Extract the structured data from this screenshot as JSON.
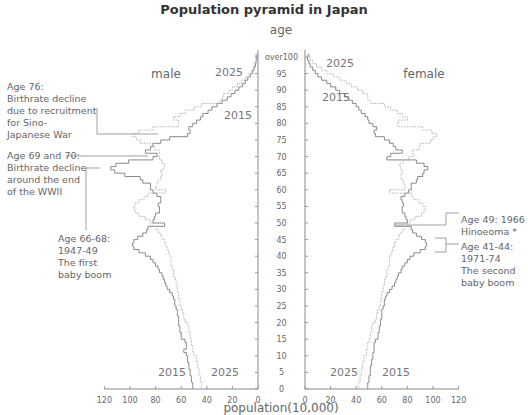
{
  "chart_data": {
    "type": "bar",
    "subtype": "population-pyramid",
    "title": "Population pyramid in Japan",
    "ylabel": "age",
    "xlabel": "population(10,000)",
    "xlim": [
      0,
      120
    ],
    "ylim": [
      0,
      100
    ],
    "x_ticks": [
      0,
      20,
      40,
      60,
      80,
      100,
      120
    ],
    "y_ticks": [
      "0",
      "5",
      "10",
      "15",
      "20",
      "25",
      "30",
      "35",
      "40",
      "45",
      "50",
      "55",
      "60",
      "65",
      "70",
      "75",
      "80",
      "85",
      "90",
      "95",
      "over100"
    ],
    "side_labels": {
      "left": "male",
      "right": "female"
    },
    "grid": false,
    "series_styles": {
      "2015": "solid",
      "2025": "dotted"
    },
    "ages": [
      0,
      1,
      2,
      3,
      4,
      5,
      6,
      7,
      8,
      9,
      10,
      11,
      12,
      13,
      14,
      15,
      16,
      17,
      18,
      19,
      20,
      21,
      22,
      23,
      24,
      25,
      26,
      27,
      28,
      29,
      30,
      31,
      32,
      33,
      34,
      35,
      36,
      37,
      38,
      39,
      40,
      41,
      42,
      43,
      44,
      45,
      46,
      47,
      48,
      49,
      50,
      51,
      52,
      53,
      54,
      55,
      56,
      57,
      58,
      59,
      60,
      61,
      62,
      63,
      64,
      65,
      66,
      67,
      68,
      69,
      70,
      71,
      72,
      73,
      74,
      75,
      76,
      77,
      78,
      79,
      80,
      81,
      82,
      83,
      84,
      85,
      86,
      87,
      88,
      89,
      90,
      91,
      92,
      93,
      94,
      95,
      96,
      97,
      98,
      99,
      100
    ],
    "series": [
      {
        "name": "male 2015",
        "side": "male",
        "year": "2015",
        "values": [
          51,
          51,
          52,
          52,
          53,
          53,
          54,
          54,
          55,
          55,
          56,
          58,
          56,
          56,
          57,
          60,
          60,
          61,
          61,
          62,
          62,
          62,
          63,
          63,
          64,
          65,
          65,
          66,
          67,
          69,
          71,
          72,
          73,
          74,
          75,
          77,
          78,
          80,
          82,
          84,
          88,
          93,
          97,
          98,
          97,
          94,
          90,
          87,
          86,
          73,
          82,
          81,
          80,
          77,
          77,
          78,
          76,
          76,
          79,
          82,
          84,
          84,
          90,
          92,
          104,
          112,
          115,
          111,
          101,
          82,
          79,
          88,
          84,
          82,
          76,
          69,
          55,
          53,
          54,
          51,
          48,
          45,
          43,
          39,
          36,
          32,
          28,
          24,
          21,
          18,
          15,
          12,
          10,
          8,
          6,
          4,
          3,
          2,
          1.5,
          1,
          0.8
        ]
      },
      {
        "name": "male 2025",
        "side": "male",
        "year": "2025",
        "values": [
          44,
          44,
          45,
          45,
          46,
          46,
          47,
          47,
          48,
          48,
          50,
          51,
          51,
          52,
          52,
          53,
          53,
          54,
          54,
          55,
          57,
          58,
          58,
          59,
          60,
          61,
          61,
          62,
          62,
          63,
          63,
          64,
          64,
          65,
          66,
          66,
          67,
          68,
          68,
          68,
          69,
          70,
          71,
          72,
          73,
          75,
          76,
          78,
          80,
          82,
          84,
          88,
          93,
          96,
          97,
          96,
          93,
          89,
          86,
          72,
          80,
          79,
          78,
          76,
          75,
          76,
          74,
          73,
          75,
          77,
          79,
          77,
          81,
          82,
          92,
          95,
          98,
          93,
          82,
          62,
          62,
          66,
          61,
          57,
          50,
          44,
          30,
          28,
          27,
          23,
          20,
          16,
          13,
          10,
          7,
          5,
          4,
          3,
          2,
          1.5,
          1.8
        ]
      },
      {
        "name": "female 2015",
        "side": "female",
        "year": "2015",
        "values": [
          49,
          49,
          50,
          50,
          51,
          51,
          51,
          52,
          52,
          53,
          53,
          54,
          54,
          54,
          55,
          57,
          57,
          58,
          58,
          59,
          59,
          60,
          60,
          60,
          61,
          62,
          62,
          63,
          64,
          66,
          68,
          70,
          71,
          72,
          73,
          75,
          76,
          78,
          80,
          82,
          85,
          90,
          94,
          95,
          94,
          91,
          87,
          84,
          83,
          70,
          80,
          79,
          78,
          76,
          76,
          77,
          76,
          75,
          78,
          81,
          83,
          83,
          87,
          88,
          92,
          93,
          96,
          93,
          87,
          64,
          67,
          76,
          71,
          69,
          66,
          62,
          55,
          54,
          56,
          53,
          50,
          49,
          47,
          44,
          42,
          40,
          37,
          34,
          31,
          27,
          24,
          20,
          17,
          13,
          10,
          8,
          6,
          4,
          3,
          2,
          2.5
        ]
      },
      {
        "name": "female 2025",
        "side": "female",
        "year": "2025",
        "values": [
          42,
          42,
          43,
          43,
          44,
          44,
          45,
          45,
          46,
          46,
          48,
          48,
          49,
          49,
          50,
          51,
          51,
          52,
          52,
          53,
          55,
          56,
          56,
          57,
          58,
          59,
          59,
          60,
          60,
          61,
          61,
          62,
          62,
          63,
          64,
          64,
          65,
          66,
          66,
          66,
          67,
          68,
          69,
          70,
          71,
          73,
          74,
          76,
          78,
          80,
          82,
          86,
          91,
          93,
          94,
          92,
          89,
          85,
          83,
          66,
          78,
          78,
          77,
          75,
          75,
          76,
          75,
          74,
          77,
          81,
          85,
          84,
          89,
          90,
          98,
          100,
          103,
          99,
          92,
          72,
          73,
          80,
          76,
          72,
          67,
          62,
          51,
          49,
          49,
          45,
          41,
          36,
          32,
          27,
          22,
          17,
          13,
          9,
          6,
          4,
          3.5
        ]
      }
    ],
    "year_labels": [
      {
        "text": "2025",
        "side": "male",
        "position": "top"
      },
      {
        "text": "2015",
        "side": "male",
        "position": "top"
      },
      {
        "text": "2015",
        "side": "male",
        "position": "bottom"
      },
      {
        "text": "2025",
        "side": "male",
        "position": "bottom"
      },
      {
        "text": "2025",
        "side": "female",
        "position": "top"
      },
      {
        "text": "2015",
        "side": "female",
        "position": "top"
      },
      {
        "text": "2025",
        "side": "female",
        "position": "bottom"
      },
      {
        "text": "2015",
        "side": "female",
        "position": "bottom"
      }
    ],
    "annotations": [
      {
        "id": "age76",
        "side": "male",
        "lines": [
          "Age 76:",
          "Birthrate decline",
          "due to recruitment",
          "for Sino-",
          "Japanese War"
        ]
      },
      {
        "id": "age69-70",
        "side": "male",
        "lines": [
          "Age 69 and 70:",
          "Birthrate decline",
          "around the end",
          "of the WWII"
        ]
      },
      {
        "id": "age66-68",
        "side": "male",
        "lines": [
          "Age 66-68:",
          "1947-49",
          "The first",
          "baby boom"
        ]
      },
      {
        "id": "age49",
        "side": "female",
        "lines": [
          "Age 49: 1966",
          "Hinoeoma *"
        ]
      },
      {
        "id": "age41-44",
        "side": "female",
        "lines": [
          "Age 41-44:",
          "1971-74",
          "The second",
          "baby boom"
        ]
      }
    ]
  }
}
